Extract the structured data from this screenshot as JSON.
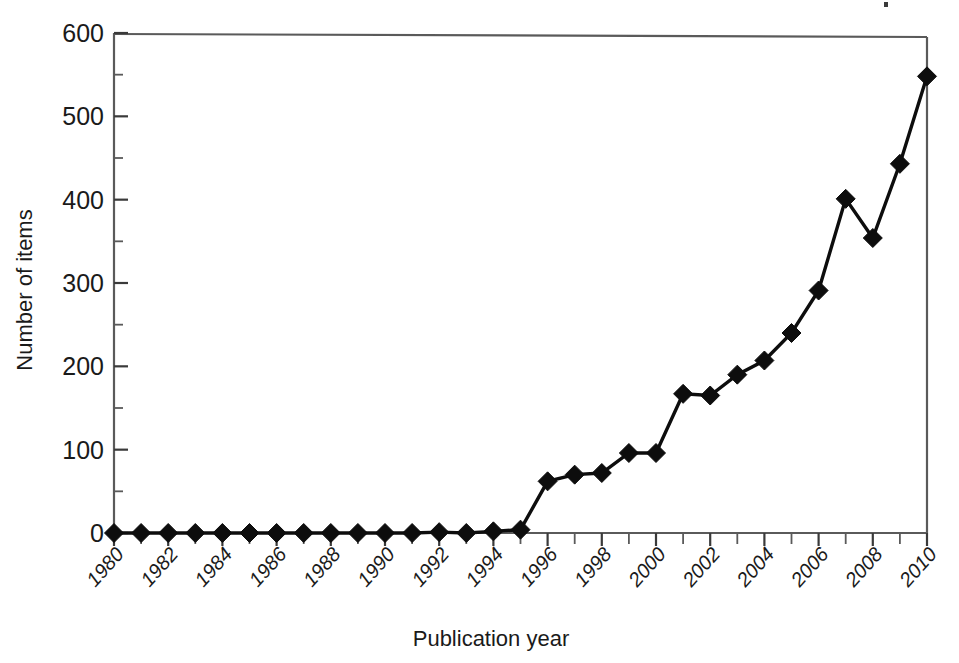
{
  "chart_data": {
    "type": "line",
    "title": "",
    "xlabel": "Publication year",
    "ylabel": "Number of items",
    "xlim": [
      1980,
      2010
    ],
    "ylim": [
      0,
      600
    ],
    "y_major_step": 100,
    "y_minor_step": 50,
    "x_tick_step": 1,
    "x_label_step": 2,
    "grid": false,
    "legend": null,
    "marker": "filled-diamond",
    "x": [
      1980,
      1981,
      1982,
      1983,
      1984,
      1985,
      1986,
      1987,
      1988,
      1989,
      1990,
      1991,
      1992,
      1993,
      1994,
      1995,
      1996,
      1997,
      1998,
      1999,
      2000,
      2001,
      2002,
      2003,
      2004,
      2005,
      2006,
      2007,
      2008,
      2009,
      2010
    ],
    "values": [
      0,
      0,
      0,
      0,
      0,
      0,
      0,
      0,
      0,
      0,
      0,
      0,
      1,
      0,
      2,
      4,
      62,
      70,
      72,
      96,
      96,
      167,
      165,
      190,
      207,
      240,
      291,
      401,
      354,
      443,
      548
    ],
    "y_tick_labels": [
      "0",
      "100",
      "200",
      "300",
      "400",
      "500",
      "600"
    ],
    "y_tick_values": [
      0,
      100,
      200,
      300,
      400,
      500,
      600
    ],
    "x_tick_labels": [
      "1980",
      "1982",
      "1984",
      "1986",
      "1988",
      "1990",
      "1992",
      "1994",
      "1996",
      "1998",
      "2000",
      "2002",
      "2004",
      "2006",
      "2008",
      "2010"
    ],
    "x_tick_label_values": [
      1980,
      1982,
      1984,
      1986,
      1988,
      1990,
      1992,
      1994,
      1996,
      1998,
      2000,
      2002,
      2004,
      2006,
      2008,
      2010
    ],
    "colors": {
      "line": "#0d0d0d",
      "marker": "#0d0d0d",
      "axis": "#5a5a5a",
      "text": "#1a1a1a",
      "background": "#ffffff"
    }
  }
}
